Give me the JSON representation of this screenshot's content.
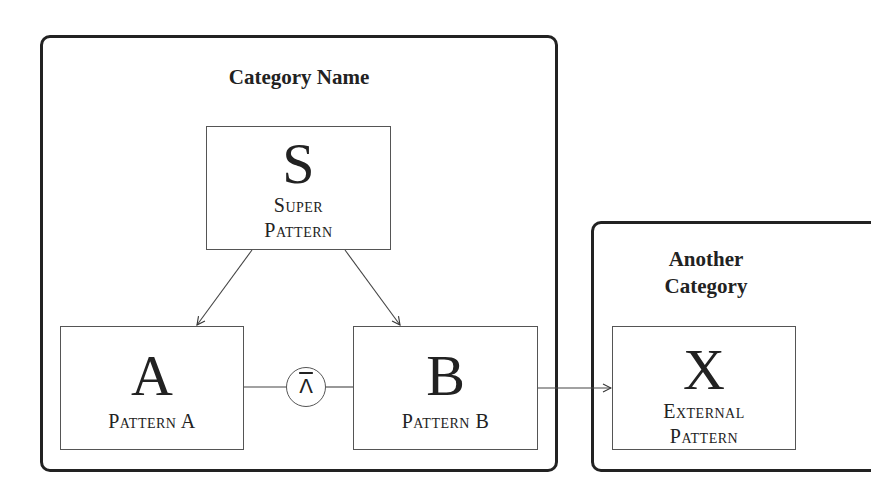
{
  "diagram": {
    "categories": [
      {
        "id": "cat1",
        "title": "Category Name",
        "patterns": [
          {
            "id": "S",
            "letter": "S",
            "name_line1": "Super",
            "name_line2": "Pattern"
          },
          {
            "id": "A",
            "letter": "A",
            "name_line1": "Pattern A",
            "name_line2": ""
          },
          {
            "id": "B",
            "letter": "B",
            "name_line1": "Pattern B",
            "name_line2": ""
          }
        ]
      },
      {
        "id": "cat2",
        "title_line1": "Another",
        "title_line2": "Category",
        "patterns": [
          {
            "id": "X",
            "letter": "X",
            "name_line1": "External",
            "name_line2": "Pattern"
          }
        ]
      }
    ],
    "operator": {
      "symbol": "⊼",
      "display": "Λ",
      "meaning": "NAND relation between A and B"
    },
    "edges": [
      {
        "from": "S",
        "to": "A",
        "type": "arrow"
      },
      {
        "from": "S",
        "to": "B",
        "type": "arrow"
      },
      {
        "from": "A",
        "to": "B",
        "type": "operator-line",
        "via": "operator"
      },
      {
        "from": "B",
        "to": "X",
        "type": "arrow"
      }
    ],
    "colors": {
      "stroke": "#222222",
      "box_stroke": "#555555",
      "background": "#ffffff"
    }
  }
}
